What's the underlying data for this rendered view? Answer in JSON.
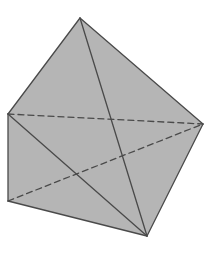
{
  "figure": {
    "fill_color": "#b5b5b5",
    "line_color": "#4a4a4a",
    "background": "#ffffff",
    "vertices": {
      "top": [
        80,
        18
      ],
      "left_upper": [
        8,
        114
      ],
      "left_lower": [
        8,
        201
      ],
      "bottom": [
        147,
        236
      ],
      "right": [
        203,
        124
      ]
    },
    "solid_edges": [
      [
        "top",
        "left_upper"
      ],
      [
        "top",
        "right"
      ],
      [
        "top",
        "bottom"
      ],
      [
        "left_upper",
        "left_lower"
      ],
      [
        "left_upper",
        "bottom"
      ],
      [
        "left_lower",
        "bottom"
      ],
      [
        "right",
        "bottom"
      ]
    ],
    "dashed_edges": [
      [
        "left_upper",
        "right"
      ],
      [
        "left_lower",
        "right"
      ]
    ]
  }
}
